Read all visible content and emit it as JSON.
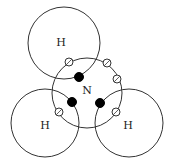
{
  "diagram": {
    "title": "",
    "molecule": "NH3",
    "colors": {
      "shell_stroke": "#333333",
      "filled_electron": "#000000",
      "open_electron": "#ffffff",
      "background": "#ffffff"
    },
    "atoms": [
      {
        "id": "H_top",
        "label": "H",
        "cx": 64,
        "cy": 43,
        "r": 36,
        "lx": 61,
        "ly": 46
      },
      {
        "id": "N",
        "label": "N",
        "cx": 87,
        "cy": 93,
        "r": 35,
        "lx": 87,
        "ly": 94
      },
      {
        "id": "H_left",
        "label": "H",
        "cx": 45,
        "cy": 123,
        "r": 34,
        "lx": 45,
        "ly": 129
      },
      {
        "id": "H_right",
        "label": "H",
        "cx": 129,
        "cy": 123,
        "r": 34,
        "lx": 128,
        "ly": 129
      }
    ],
    "electrons": [
      {
        "type": "open",
        "x": 69,
        "y": 62
      },
      {
        "type": "open",
        "x": 107,
        "y": 63
      },
      {
        "type": "open",
        "x": 117,
        "y": 79
      },
      {
        "type": "open",
        "x": 59,
        "y": 112
      },
      {
        "type": "open",
        "x": 116,
        "y": 112
      },
      {
        "type": "filled",
        "x": 79,
        "y": 77
      },
      {
        "type": "filled",
        "x": 72,
        "y": 102
      },
      {
        "type": "filled",
        "x": 100,
        "y": 103
      }
    ],
    "labels": {
      "h_top": "H",
      "n": "N",
      "h_left": "H",
      "h_right": "H"
    }
  }
}
